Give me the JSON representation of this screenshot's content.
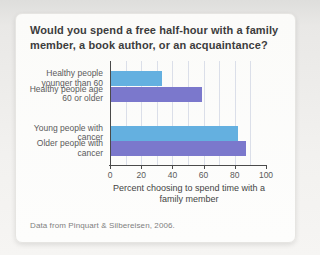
{
  "title": "Would you spend a free half-hour with a family member, a book author, or an acquaintance?",
  "caption": "Data from Pinquart & Silbereisen, 2006.",
  "colors": {
    "bar_blue": "#64b0e0",
    "bar_purple": "#7b78cc",
    "gridline": "#dbdfe9",
    "axis": "#4a4a4a"
  },
  "chart_data": {
    "type": "bar",
    "orientation": "horizontal",
    "title": "Would you spend a free half-hour with a family member, a book author, or an acquaintance?",
    "categories": [
      "Healthy people younger than 60",
      "Healthy people age 60 or older",
      "Young people with cancer",
      "Older people with cancer"
    ],
    "values": [
      33,
      59,
      82,
      87
    ],
    "bar_colors": [
      "#64b0e0",
      "#7b78cc",
      "#64b0e0",
      "#7b78cc"
    ],
    "xlabel": "Percent choosing to spend time with a family member",
    "xlim": [
      0,
      100
    ],
    "xticks": [
      0,
      20,
      40,
      60,
      80,
      100
    ],
    "gridline_interval": 10,
    "grid": true,
    "legend": "none",
    "source_note": "Data from Pinquart & Silbereisen, 2006."
  }
}
